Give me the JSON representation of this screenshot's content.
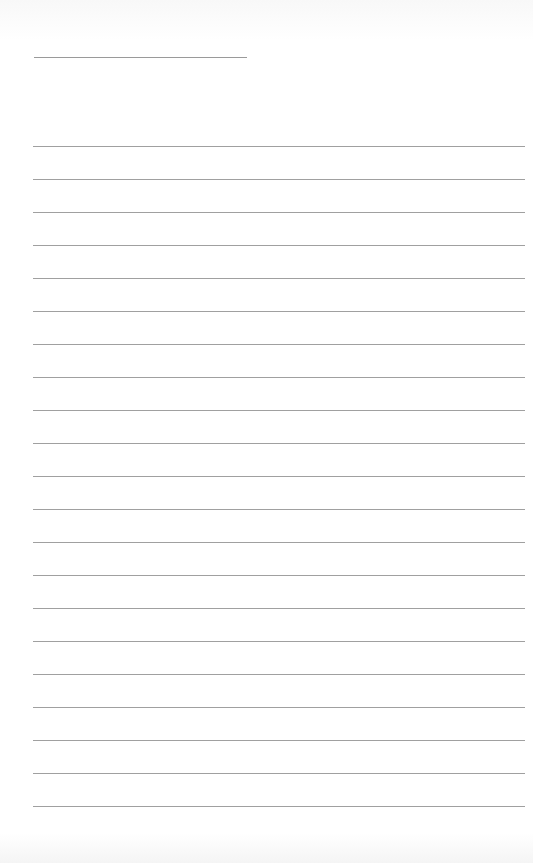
{
  "page": {
    "background": "#ffffff",
    "line_color": "#9a9a9a"
  },
  "header_line": {
    "x1": 34,
    "x2": 247,
    "y": 57,
    "label": ""
  },
  "ruled_lines": {
    "count": 21,
    "x1": 33,
    "x2": 525,
    "first_y": 146,
    "spacing": 33,
    "entries": [
      "",
      "",
      "",
      "",
      "",
      "",
      "",
      "",
      "",
      "",
      "",
      "",
      "",
      "",
      "",
      "",
      "",
      "",
      "",
      "",
      ""
    ]
  }
}
